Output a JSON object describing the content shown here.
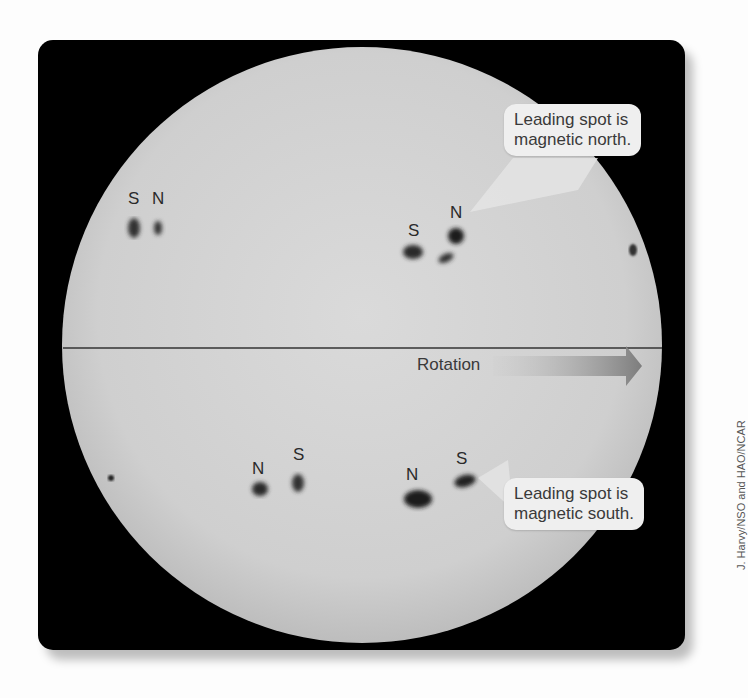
{
  "figure": {
    "credit": "J. Harvy/NSO and HAO/NCAR",
    "colors": {
      "frame": "#000000",
      "sun_disk": "#d4d4d4",
      "callout_bg": "#efefef",
      "arrow": "#8a8a8a",
      "text": "#333333"
    }
  },
  "equator": {
    "label": "Rotation",
    "arrow_icon": "right-arrow"
  },
  "callouts": {
    "north": "Leading spot is magnetic north.",
    "north_line1": "Leading spot is",
    "north_line2": "magnetic north.",
    "south_line1": "Leading spot is",
    "south_line2": "magnetic south."
  },
  "spot_pairs": [
    {
      "hemisphere": "northern",
      "labels": [
        "S",
        "N"
      ],
      "position": "upper-left"
    },
    {
      "hemisphere": "northern",
      "labels": [
        "S",
        "N"
      ],
      "position": "upper-right"
    },
    {
      "hemisphere": "southern",
      "labels": [
        "N",
        "S"
      ],
      "position": "lower-left"
    },
    {
      "hemisphere": "southern",
      "labels": [
        "N",
        "S"
      ],
      "position": "lower-right"
    }
  ],
  "labels": {
    "ul_s": "S",
    "ul_n": "N",
    "ur_s": "S",
    "ur_n": "N",
    "ll_n": "N",
    "ll_s": "S",
    "lr_n": "N",
    "lr_s": "S"
  }
}
